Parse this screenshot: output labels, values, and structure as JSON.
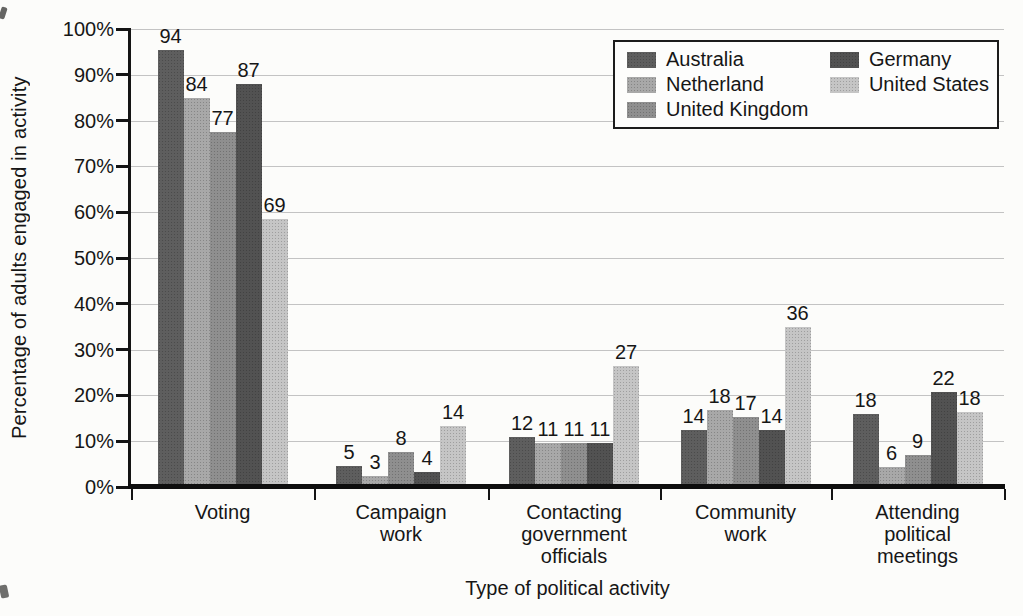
{
  "meta": {
    "canvas_width": 1023,
    "canvas_height": 616
  },
  "colors": {
    "background": "#fcfcfa",
    "axis": "#141414",
    "grid": "#c3c3c3",
    "text": "#161616",
    "legend_background": "#fdfdfc",
    "legend_border": "#1c1c1c"
  },
  "chart_data": {
    "type": "bar",
    "title": "",
    "xlabel": "Type of political activity",
    "ylabel": "Percentage of adults engaged in activity",
    "ylim": [
      0,
      100
    ],
    "ytick_step": 10,
    "ytick_labels": [
      "0%",
      "10%",
      "20%",
      "30%",
      "40%",
      "50%",
      "60%",
      "70%",
      "80%",
      "90%",
      "100%"
    ],
    "grid": "horizontal",
    "legend_position": "top-right",
    "categories": [
      "Voting",
      "Campaign work",
      "Contacting government officials",
      "Community work",
      "Attending political meetings"
    ],
    "category_label_lines": [
      [
        "Voting"
      ],
      [
        "Campaign",
        "work"
      ],
      [
        "Contacting",
        "government",
        "officials"
      ],
      [
        "Community",
        "work"
      ],
      [
        "Attending",
        "political",
        "meetings"
      ]
    ],
    "series": [
      {
        "name": "Australia",
        "color": "#5e5e5e",
        "values": [
          94,
          5,
          12,
          14,
          18
        ],
        "drawn_bar_heights": [
          95.5,
          4.6,
          11,
          12.5,
          16
        ]
      },
      {
        "name": "Netherland",
        "color": "#a8a8a8",
        "values": [
          84,
          3,
          11,
          18,
          6
        ],
        "drawn_bar_heights": [
          85,
          2.5,
          9.6,
          16.8,
          4.3
        ]
      },
      {
        "name": "United Kingdom",
        "color": "#8f8f8f",
        "values": [
          77,
          8,
          11,
          17,
          9
        ],
        "drawn_bar_heights": [
          77.5,
          7.6,
          9.6,
          15.2,
          7
        ]
      },
      {
        "name": "Germany",
        "color": "#525252",
        "values": [
          87,
          4,
          11,
          14,
          22
        ],
        "drawn_bar_heights": [
          88,
          3.2,
          9.6,
          12.5,
          20.7
        ]
      },
      {
        "name": "United States",
        "color": "#c5c5c5",
        "values": [
          69,
          14,
          27,
          36,
          18
        ],
        "drawn_bar_heights": [
          58.5,
          13.4,
          26.5,
          35,
          16.3
        ]
      }
    ],
    "legend_columns": [
      [
        0,
        1,
        2
      ],
      [
        3,
        4
      ]
    ]
  }
}
